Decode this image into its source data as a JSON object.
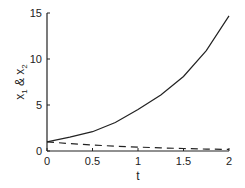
{
  "chart_data": {
    "type": "line",
    "title": "",
    "xlabel": "t",
    "ylabel": "x1 & x2",
    "xlim": [
      0,
      2
    ],
    "ylim": [
      0,
      15
    ],
    "xticks": [
      "0",
      "0.5",
      "1",
      "1.5",
      "2"
    ],
    "yticks": [
      "0",
      "5",
      "10",
      "15"
    ],
    "grid": false,
    "legend": null,
    "x": [
      0,
      0.25,
      0.5,
      0.75,
      1,
      1.25,
      1.5,
      1.75,
      2
    ],
    "series": [
      {
        "name": "x1",
        "style": "solid",
        "values": [
          1.0,
          1.5,
          2.1,
          3.1,
          4.5,
          6.1,
          8.1,
          10.9,
          14.7
        ]
      },
      {
        "name": "x2",
        "style": "dashed",
        "values": [
          1.0,
          0.8,
          0.65,
          0.52,
          0.42,
          0.34,
          0.27,
          0.21,
          0.17
        ]
      }
    ]
  }
}
